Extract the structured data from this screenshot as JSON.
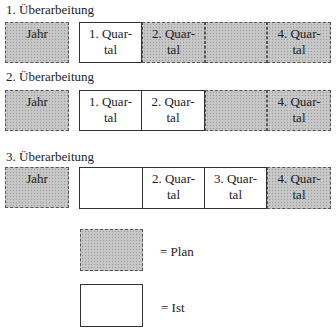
{
  "rows": [
    {
      "heading": "1. Überarbeitung",
      "year": {
        "label": "Jahr",
        "type": "plan"
      },
      "cells": [
        {
          "line1": "1. Quar-",
          "line2": "tal",
          "type": "ist"
        },
        {
          "line1": "2. Quar-",
          "line2": "tal",
          "type": "plan"
        },
        {
          "line1": "",
          "line2": "",
          "type": "plan"
        },
        {
          "line1": "4. Quar-",
          "line2": "tal",
          "type": "plan"
        }
      ]
    },
    {
      "heading": "2. Überarbeitung",
      "year": {
        "label": "Jahr",
        "type": "plan"
      },
      "cells": [
        {
          "line1": "1. Quar-",
          "line2": "tal",
          "type": "ist"
        },
        {
          "line1": "2. Quar-",
          "line2": "tal",
          "type": "ist"
        },
        {
          "line1": "",
          "line2": "",
          "type": "plan"
        },
        {
          "line1": "4. Quar-",
          "line2": "tal",
          "type": "plan"
        }
      ]
    },
    {
      "heading": "3. Überarbeitung",
      "year": {
        "label": "Jahr",
        "type": "plan"
      },
      "cells": [
        {
          "line1": "",
          "line2": "",
          "type": "ist"
        },
        {
          "line1": "2. Quar-",
          "line2": "tal",
          "type": "ist"
        },
        {
          "line1": "3. Quar-",
          "line2": "tal",
          "type": "ist"
        },
        {
          "line1": "4. Quar-",
          "line2": "tal",
          "type": "plan"
        }
      ]
    }
  ],
  "legend": {
    "plan": "= Plan",
    "ist": "= Ist"
  },
  "colors": {
    "plan_fill": "#c4c4c4",
    "ist_fill": "#ffffff",
    "border": "#333333"
  }
}
